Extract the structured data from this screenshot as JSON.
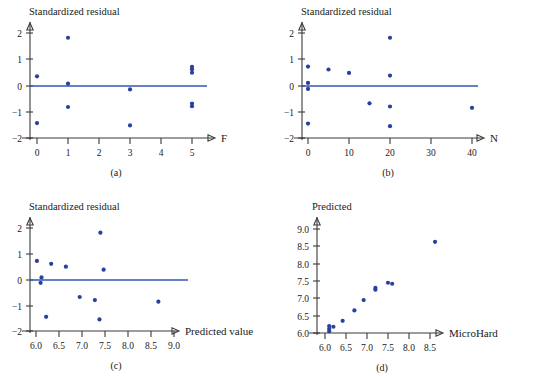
{
  "figure": {
    "panels": [
      {
        "id": "a",
        "caption": "(a)",
        "ylabel": "Standardized residual",
        "xlabel": "F",
        "xticks": [
          "0",
          "1",
          "2",
          "3",
          "4",
          "5"
        ],
        "yticks": [
          "2",
          "1",
          "0",
          "−1",
          "−2"
        ],
        "reference_line": 0
      },
      {
        "id": "b",
        "caption": "(b)",
        "ylabel": "Standardized residual",
        "xlabel": "N",
        "xticks": [
          "0",
          "10",
          "20",
          "30",
          "40"
        ],
        "yticks": [
          "2",
          "1",
          "0",
          "−1",
          "−2"
        ],
        "reference_line": 0
      },
      {
        "id": "c",
        "caption": "(c)",
        "ylabel": "Standardized residual",
        "xlabel": "Predicted value",
        "xticks": [
          "6.0",
          "6.5",
          "7.0",
          "7.5",
          "8.0",
          "8.5",
          "9.0"
        ],
        "yticks": [
          "2",
          "1",
          "0",
          "−1",
          "−2"
        ],
        "reference_line": 0
      },
      {
        "id": "d",
        "caption": "(d)",
        "ylabel": "Predicted",
        "xlabel": "MicroHard",
        "xticks": [
          "6.0",
          "6.5",
          "7.0",
          "7.5",
          "8.0",
          "8.5"
        ],
        "yticks": [
          "9.0",
          "8.5",
          "8.0",
          "7.5",
          "7.0",
          "6.5",
          "6.0"
        ],
        "reference_line": null
      }
    ],
    "colors": {
      "point": "#2a3f9e",
      "reference_line": "#2f57b0",
      "axis": "#3a3a3a",
      "background": "#ffffff"
    }
  },
  "chart_data": [
    {
      "type": "scatter",
      "id": "a",
      "title": "",
      "xlabel": "F",
      "ylabel": "Standardized residual",
      "xlim": [
        -0.55,
        5.6
      ],
      "ylim": [
        -2.15,
        2.3
      ],
      "xticks": [
        0,
        1,
        2,
        3,
        4,
        5
      ],
      "yticks": [
        -2,
        -1,
        0,
        1,
        2
      ],
      "grid": false,
      "legend": null,
      "reference_line_y": 0,
      "points": [
        {
          "x": 0,
          "y": 0.35
        },
        {
          "x": 0,
          "y": -1.43
        },
        {
          "x": 1,
          "y": 1.82
        },
        {
          "x": 1,
          "y": 0.07
        },
        {
          "x": 1,
          "y": -0.82
        },
        {
          "x": 3,
          "y": -0.15
        },
        {
          "x": 3,
          "y": -1.52
        },
        {
          "x": 5,
          "y": 0.71
        },
        {
          "x": 5,
          "y": 0.62
        },
        {
          "x": 5,
          "y": 0.49
        },
        {
          "x": 5,
          "y": -0.69
        },
        {
          "x": 5,
          "y": -0.79
        }
      ]
    },
    {
      "type": "scatter",
      "id": "b",
      "title": "",
      "xlabel": "N",
      "ylabel": "Standardized residual",
      "xlim": [
        -4.5,
        45
      ],
      "ylim": [
        -2.15,
        2.3
      ],
      "xticks": [
        0,
        10,
        20,
        30,
        40
      ],
      "yticks": [
        -2,
        -1,
        0,
        1,
        2
      ],
      "grid": false,
      "legend": null,
      "reference_line_y": 0,
      "points": [
        {
          "x": 0,
          "y": 0.72
        },
        {
          "x": 0,
          "y": 0.1
        },
        {
          "x": 0,
          "y": -0.13
        },
        {
          "x": 0,
          "y": -1.45
        },
        {
          "x": 5,
          "y": 0.61
        },
        {
          "x": 10,
          "y": 0.48
        },
        {
          "x": 15,
          "y": -0.68
        },
        {
          "x": 20,
          "y": 1.82
        },
        {
          "x": 20,
          "y": 0.38
        },
        {
          "x": 20,
          "y": -0.8
        },
        {
          "x": 20,
          "y": -1.55
        },
        {
          "x": 40,
          "y": -0.85
        }
      ]
    },
    {
      "type": "scatter",
      "id": "c",
      "title": "",
      "xlabel": "Predicted value",
      "ylabel": "Standardized residual",
      "xlim": [
        5.75,
        9.25
      ],
      "ylim": [
        -2.15,
        2.3
      ],
      "xticks": [
        6.0,
        6.5,
        7.0,
        7.5,
        8.0,
        8.5,
        9.0
      ],
      "yticks": [
        -2,
        -1,
        0,
        1,
        2
      ],
      "grid": false,
      "legend": null,
      "reference_line_y": 0,
      "points": [
        {
          "x": 6.02,
          "y": 0.72
        },
        {
          "x": 6.12,
          "y": 0.08
        },
        {
          "x": 6.1,
          "y": -0.13
        },
        {
          "x": 6.22,
          "y": -1.45
        },
        {
          "x": 6.33,
          "y": 0.61
        },
        {
          "x": 6.65,
          "y": 0.5
        },
        {
          "x": 6.95,
          "y": -0.68
        },
        {
          "x": 7.28,
          "y": -0.8
        },
        {
          "x": 7.4,
          "y": 1.82
        },
        {
          "x": 7.47,
          "y": 0.38
        },
        {
          "x": 7.38,
          "y": -1.55
        },
        {
          "x": 8.66,
          "y": -0.86
        }
      ]
    },
    {
      "type": "scatter",
      "id": "d",
      "title": "",
      "xlabel": "MicroHard",
      "ylabel": "Predicted",
      "xlim": [
        5.8,
        8.85
      ],
      "ylim": [
        5.85,
        9.25
      ],
      "xticks": [
        6.0,
        6.5,
        7.0,
        7.5,
        8.0,
        8.5
      ],
      "yticks": [
        6.0,
        6.5,
        7.0,
        7.5,
        8.0,
        8.5,
        9.0
      ],
      "grid": false,
      "legend": null,
      "reference_line_y": null,
      "points": [
        {
          "x": 6.1,
          "y": 6.2
        },
        {
          "x": 6.1,
          "y": 6.12
        },
        {
          "x": 6.1,
          "y": 6.05
        },
        {
          "x": 6.2,
          "y": 6.18
        },
        {
          "x": 6.42,
          "y": 6.35
        },
        {
          "x": 6.7,
          "y": 6.65
        },
        {
          "x": 6.92,
          "y": 6.95
        },
        {
          "x": 7.2,
          "y": 7.3
        },
        {
          "x": 7.2,
          "y": 7.25
        },
        {
          "x": 7.5,
          "y": 7.45
        },
        {
          "x": 7.6,
          "y": 7.42
        },
        {
          "x": 8.62,
          "y": 8.63
        }
      ]
    }
  ]
}
